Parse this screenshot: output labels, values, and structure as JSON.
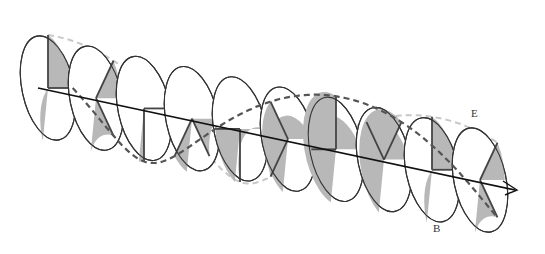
{
  "diagram": {
    "type": "electromagnetic-wave",
    "labels": {
      "electric_field": "E",
      "magnetic_field": "B"
    },
    "planes": 10,
    "colors": {
      "fill": "#b8b8b8",
      "outline": "#333333",
      "axis": "#111111",
      "e_curve": "#c8c8c8",
      "b_curve": "#555555"
    },
    "plane_rotation_degrees": [
      90,
      45,
      0,
      -45,
      -90,
      -135,
      180,
      135,
      90,
      45
    ]
  }
}
